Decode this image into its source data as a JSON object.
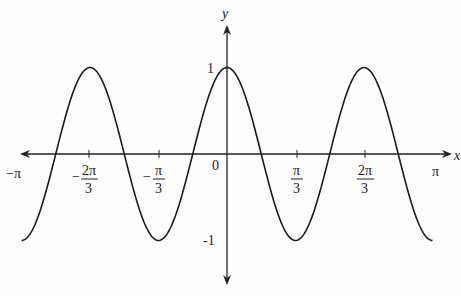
{
  "chart_data": {
    "type": "line",
    "title": "",
    "function": "y = cos(3x)",
    "xlabel": "x",
    "ylabel": "y",
    "xlim": [
      -3.14159,
      3.14159
    ],
    "ylim": [
      -1,
      1
    ],
    "grid": false,
    "legend": null,
    "x_ticks": [
      {
        "value": -3.14159,
        "label": "−π",
        "num": "",
        "den": ""
      },
      {
        "value": -2.0944,
        "label": "-2π/3",
        "sign": "−",
        "num": "2π",
        "den": "3"
      },
      {
        "value": -1.0472,
        "label": "-π/3",
        "sign": "−",
        "num": "π",
        "den": "3"
      },
      {
        "value": 0,
        "label": "0"
      },
      {
        "value": 1.0472,
        "label": "π/3",
        "sign": "",
        "num": "π",
        "den": "3"
      },
      {
        "value": 2.0944,
        "label": "2π/3",
        "sign": "",
        "num": "2π",
        "den": "3"
      },
      {
        "value": 3.14159,
        "label": "π"
      }
    ],
    "y_ticks": [
      {
        "value": 1,
        "label": "1"
      },
      {
        "value": -1,
        "label": "-1"
      }
    ],
    "series": [
      {
        "name": "cos(3x)",
        "x": [
          -3.14159,
          -2.618,
          -2.0944,
          -1.5708,
          -1.0472,
          -0.5236,
          0,
          0.5236,
          1.0472,
          1.5708,
          2.0944,
          2.618,
          3.14159
        ],
        "y": [
          -1,
          0,
          1,
          0,
          -1,
          0,
          1,
          0,
          -1,
          0,
          1,
          0,
          -1
        ]
      }
    ]
  },
  "labels": {
    "x_axis": "x",
    "y_axis": "y",
    "origin": "0",
    "neg_pi": "−π",
    "pi": "π",
    "y_one": "1",
    "y_neg_one": "-1",
    "neg_2pi3_sign": "−",
    "neg_2pi3_num": "2π",
    "neg_2pi3_den": "3",
    "neg_pi3_sign": "−",
    "neg_pi3_num": "π",
    "neg_pi3_den": "3",
    "pi3_num": "π",
    "pi3_den": "3",
    "two_pi3_num": "2π",
    "two_pi3_den": "3"
  }
}
